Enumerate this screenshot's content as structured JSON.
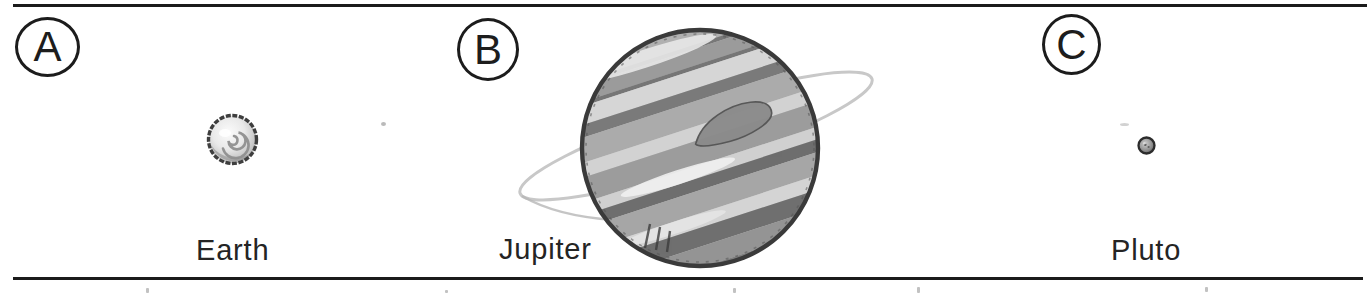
{
  "figure": {
    "panels": [
      {
        "letter": "A",
        "planet": "Earth"
      },
      {
        "letter": "B",
        "planet": "Jupiter"
      },
      {
        "letter": "C",
        "planet": "Pluto"
      }
    ]
  },
  "colors": {
    "ink": "#1c1c1c",
    "paper": "#ffffff",
    "sketch_gray": "#9a9a9a",
    "ring_gray": "#c8c8c8"
  }
}
